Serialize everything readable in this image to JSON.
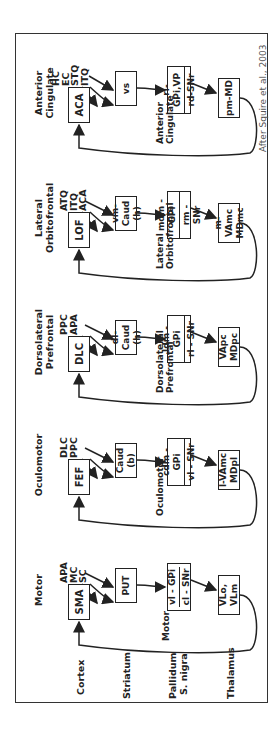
{
  "attribution": "After Squire et al., 2003",
  "row_labels": [
    "Cortex",
    "Striatum",
    "Pallidum",
    "S. nigra",
    "Thalamus"
  ],
  "circuits": [
    {
      "title": [
        "Motor",
        ""
      ],
      "inputs": [
        "APA",
        "MC",
        "SC"
      ],
      "cortex": "SMA",
      "striatum": [
        "PUT",
        ""
      ],
      "pallidum_top": "vl - GPi",
      "pallidum_bottom": "cl - SNr",
      "thalamus": [
        "VLo,",
        "VLm"
      ],
      "loop_label": [
        "Motor",
        ""
      ]
    },
    {
      "title": [
        "Oculomotor",
        ""
      ],
      "inputs": [
        "DLC",
        "PPC",
        ""
      ],
      "cortex": "FEF",
      "striatum": [
        "Caud",
        "(b)"
      ],
      "pallidum_top": "cdm - GPi",
      "pallidum_bottom": "vl - SNr",
      "thalamus": [
        "l-VAmc",
        "MDpl"
      ],
      "loop_label": [
        "Oculomotor",
        ""
      ]
    },
    {
      "title": [
        "Dorsolateral",
        "Prefrontal"
      ],
      "inputs": [
        "PPC",
        "APA",
        ""
      ],
      "cortex": "DLC",
      "striatum": [
        "dl-Caud",
        "(h)"
      ],
      "pallidum_top": "ldm - GPi",
      "pallidum_bottom": "rl - SNr",
      "thalamus": [
        "VApc",
        "MDpc"
      ],
      "loop_label": [
        "Dorsolateral",
        "Prefrontal"
      ]
    },
    {
      "title": [
        "Lateral",
        "Orbitofrontal"
      ],
      "inputs": [
        "ATQ",
        "ITQ",
        "ACA"
      ],
      "cortex": "LOF",
      "striatum": [
        "vm-Caud",
        "(h)"
      ],
      "pallidum_top": "mdm - GPi",
      "pallidum_bottom": "rm - SNr",
      "thalamus": [
        "m-VAmc",
        "MDmc"
      ],
      "loop_label": [
        "Lateral",
        "Orbitofrontal"
      ]
    },
    {
      "title": [
        "Anterior",
        "Cingulate"
      ],
      "inputs": [
        "HC",
        "EC",
        "STQ",
        "ITQ"
      ],
      "cortex": "ACA",
      "striatum": [
        "vs",
        ""
      ],
      "pallidum_top": "rl-GPi,VP",
      "pallidum_bottom": "rd-SNr",
      "thalamus": [
        "pm-MD",
        ""
      ],
      "loop_label": [
        "Anterior",
        "Cingulate"
      ]
    }
  ]
}
